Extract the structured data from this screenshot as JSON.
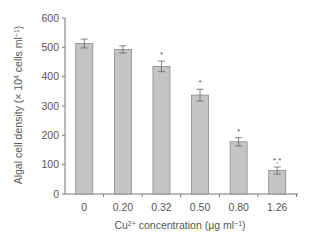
{
  "chart_data": {
    "type": "bar",
    "title": "",
    "categories": [
      "0",
      "0.20",
      "0.32",
      "0.50",
      "0.80",
      "1.26"
    ],
    "values": [
      513,
      493,
      435,
      337,
      178,
      80
    ],
    "errors": [
      15,
      12,
      18,
      20,
      14,
      12
    ],
    "significance": [
      "",
      "",
      "*",
      "*",
      "*",
      "*,*"
    ],
    "xlabel": "Cu²⁺ concentration (μg ml⁻¹)",
    "xlabel_parts": {
      "pre": "Cu",
      "sup1": "2+",
      "mid": " concentration (μg ml",
      "sup2": "−1",
      "post": ")"
    },
    "ylabel": "Algal cell density (× 10⁴ cells ml⁻¹)",
    "ylabel_parts": {
      "pre": "Algal cell density (× 10",
      "sup1": "4",
      "mid": " cells ml",
      "sup2": "−1",
      "post": ")"
    },
    "ylim": [
      0,
      600
    ],
    "yticks": [
      0,
      100,
      200,
      300,
      400,
      500,
      600
    ],
    "grid": false,
    "legend": null,
    "colors": {
      "bar_fill": "#c4c4c4",
      "bar_stroke": "#8a8a8a",
      "axis": "#777777",
      "text": "#555555"
    }
  }
}
